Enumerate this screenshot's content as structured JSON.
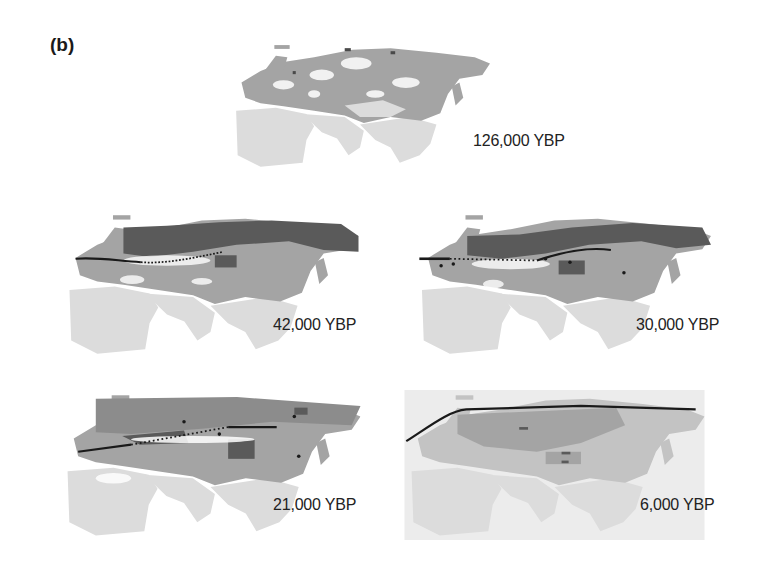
{
  "figure": {
    "panel_label": "(b)",
    "region": "Eurasia",
    "colors": {
      "background": "#ffffff",
      "desert_light": "#dcdcdc",
      "suitable_mid": "#a4a4a4",
      "suitable_dark": "#5a5a5a",
      "range_line": "#1a1a1a",
      "text": "#222222"
    },
    "maps": [
      {
        "id": "126k",
        "label": "126,000 YBP",
        "range_line": "none"
      },
      {
        "id": "42k",
        "label": "42,000 YBP",
        "range_line": "solid-then-dotted southern limit"
      },
      {
        "id": "30k",
        "label": "30,000 YBP",
        "range_line": "mixed solid/dotted southern limit"
      },
      {
        "id": "21k",
        "label": "21,000 YBP",
        "range_line": "mixed solid/dotted southern limit"
      },
      {
        "id": "6k",
        "label": "6,000 YBP",
        "range_line": "solid northern coast limit"
      }
    ]
  }
}
